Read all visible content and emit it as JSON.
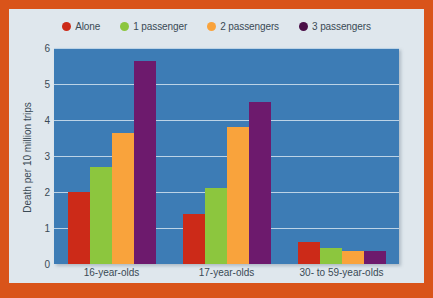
{
  "figure": {
    "frame_color": "#d9541a",
    "card_color": "#dfe7ed",
    "plot_background": "#3d7cb5",
    "gridline_color": "#bcd3e6"
  },
  "chart_data": {
    "type": "bar",
    "title": "",
    "xlabel": "",
    "ylabel": "Death per 10 million trips",
    "ylim": [
      0,
      6
    ],
    "yticks": [
      0,
      1,
      2,
      3,
      4,
      5,
      6
    ],
    "ytick_labels": [
      "0",
      "1",
      "2",
      "3",
      "4",
      "5",
      "6"
    ],
    "grid": true,
    "legend_position": "top",
    "categories": [
      "16-year-olds",
      "17-year-olds",
      "30- to 59-year-olds"
    ],
    "series": [
      {
        "name": "Alone",
        "color": "#cc2a18",
        "values": [
          2.0,
          1.4,
          0.6
        ]
      },
      {
        "name": "1 passenger",
        "color": "#8cc63e",
        "values": [
          2.7,
          2.1,
          0.45
        ]
      },
      {
        "name": "2 passengers",
        "color": "#f9a33c",
        "values": [
          3.65,
          3.8,
          0.35
        ]
      },
      {
        "name": "3 passengers",
        "color": "#6d1a6d",
        "values": [
          5.65,
          4.5,
          0.35
        ]
      }
    ],
    "legend_marker_colors": {
      "Alone": "#cc2a18",
      "1 passenger": "#8cc63e",
      "2 passengers": "#f9a33c",
      "3 passengers": "#4b1048"
    }
  }
}
